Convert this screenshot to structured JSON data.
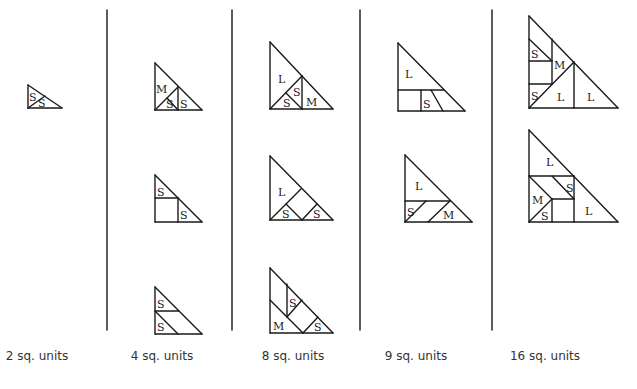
{
  "captions": [
    {
      "text": "2 sq. units",
      "x": 37
    },
    {
      "text": "4 sq. units",
      "x": 162
    },
    {
      "text": "8 sq. units",
      "x": 293
    },
    {
      "text": "9 sq. units",
      "x": 416
    },
    {
      "text": "16 sq. units",
      "x": 545
    }
  ],
  "dividers": [
    107,
    232,
    360,
    492
  ],
  "divider_y": [
    10,
    330
  ],
  "colors": {
    "line": "#1a1a1a",
    "divider": "#333333",
    "caption": "#333333"
  },
  "figures": [
    {
      "name": "figure-2-units",
      "lines": [
        [
          28,
          85,
          28,
          108
        ],
        [
          28,
          108,
          62,
          108
        ],
        [
          28,
          85,
          62,
          108
        ],
        [
          28,
          108,
          45,
          96
        ]
      ],
      "labels": [
        {
          "t": "S",
          "x": 29,
          "y": 101
        },
        {
          "t": "S",
          "x": 38,
          "y": 107
        }
      ]
    },
    {
      "name": "figure-4-units-a",
      "lines": [
        [
          155,
          63,
          155,
          110
        ],
        [
          155,
          110,
          202,
          110
        ],
        [
          155,
          63,
          202,
          110
        ],
        [
          178,
          87,
          178,
          110
        ],
        [
          155,
          110,
          178,
          87
        ],
        [
          167,
          98,
          178,
          110
        ]
      ],
      "labels": [
        {
          "t": "M",
          "x": 156,
          "y": 93
        },
        {
          "t": "S",
          "x": 166,
          "y": 108
        },
        {
          "t": "S",
          "x": 180,
          "y": 108
        }
      ]
    },
    {
      "name": "figure-4-units-b",
      "lines": [
        [
          155,
          175,
          155,
          222
        ],
        [
          155,
          222,
          202,
          222
        ],
        [
          155,
          175,
          202,
          222
        ],
        [
          155,
          198,
          178,
          198
        ],
        [
          178,
          198,
          178,
          222
        ]
      ],
      "labels": [
        {
          "t": "S",
          "x": 157,
          "y": 196
        },
        {
          "t": "S",
          "x": 180,
          "y": 219
        }
      ]
    },
    {
      "name": "figure-4-units-c",
      "lines": [
        [
          155,
          287,
          155,
          334
        ],
        [
          155,
          334,
          202,
          334
        ],
        [
          155,
          287,
          202,
          334
        ],
        [
          155,
          311,
          179,
          311
        ],
        [
          155,
          311,
          178,
          334
        ]
      ],
      "labels": [
        {
          "t": "S",
          "x": 157,
          "y": 308
        },
        {
          "t": "S",
          "x": 157,
          "y": 331
        }
      ]
    },
    {
      "name": "figure-8-units-a",
      "lines": [
        [
          270,
          42,
          270,
          109
        ],
        [
          270,
          109,
          333,
          109
        ],
        [
          270,
          42,
          333,
          109
        ],
        [
          302,
          76,
          302,
          109
        ],
        [
          270,
          109,
          302,
          76
        ],
        [
          286,
          93,
          302,
          109
        ]
      ],
      "labels": [
        {
          "t": "L",
          "x": 278,
          "y": 83
        },
        {
          "t": "S",
          "x": 283,
          "y": 107
        },
        {
          "t": "S",
          "x": 293,
          "y": 96
        },
        {
          "t": "M",
          "x": 306,
          "y": 106
        }
      ]
    },
    {
      "name": "figure-8-units-b",
      "lines": [
        [
          270,
          156,
          270,
          220
        ],
        [
          270,
          220,
          333,
          220
        ],
        [
          270,
          156,
          333,
          220
        ],
        [
          270,
          220,
          301,
          189
        ],
        [
          286,
          204,
          302,
          220
        ],
        [
          302,
          220,
          317,
          204
        ]
      ],
      "labels": [
        {
          "t": "L",
          "x": 278,
          "y": 196
        },
        {
          "t": "S",
          "x": 282,
          "y": 218
        },
        {
          "t": "S",
          "x": 313,
          "y": 218
        }
      ]
    },
    {
      "name": "figure-8-units-c",
      "lines": [
        [
          270,
          268,
          270,
          333
        ],
        [
          270,
          333,
          333,
          333
        ],
        [
          270,
          268,
          333,
          333
        ],
        [
          270,
          300,
          303,
          333
        ],
        [
          287,
          284,
          287,
          317
        ],
        [
          287,
          317,
          302,
          300
        ],
        [
          303,
          333,
          318,
          317
        ]
      ],
      "labels": [
        {
          "t": "S",
          "x": 289,
          "y": 307
        },
        {
          "t": "M",
          "x": 273,
          "y": 330
        },
        {
          "t": "S",
          "x": 314,
          "y": 331
        }
      ]
    },
    {
      "name": "figure-9-units-a",
      "lines": [
        [
          398,
          43,
          398,
          111
        ],
        [
          398,
          111,
          465,
          111
        ],
        [
          398,
          43,
          465,
          111
        ],
        [
          398,
          90,
          444,
          90
        ],
        [
          421,
          90,
          421,
          111
        ],
        [
          431,
          90,
          443,
          111
        ]
      ],
      "labels": [
        {
          "t": "L",
          "x": 405,
          "y": 78
        },
        {
          "t": "S",
          "x": 423,
          "y": 108
        }
      ]
    },
    {
      "name": "figure-9-units-b",
      "lines": [
        [
          405,
          155,
          405,
          222
        ],
        [
          405,
          222,
          472,
          222
        ],
        [
          405,
          155,
          472,
          222
        ],
        [
          405,
          201,
          450,
          201
        ],
        [
          405,
          222,
          426,
          201
        ],
        [
          428,
          222,
          450,
          201
        ]
      ],
      "labels": [
        {
          "t": "L",
          "x": 415,
          "y": 190
        },
        {
          "t": "S",
          "x": 407,
          "y": 216
        },
        {
          "t": "M",
          "x": 443,
          "y": 219
        }
      ]
    },
    {
      "name": "figure-16-units-a",
      "lines": [
        [
          529,
          16,
          529,
          108
        ],
        [
          529,
          108,
          618,
          108
        ],
        [
          529,
          16,
          618,
          108
        ],
        [
          529,
          39,
          552,
          61
        ],
        [
          529,
          61,
          552,
          61
        ],
        [
          552,
          39,
          552,
          84
        ],
        [
          529,
          84,
          552,
          84
        ],
        [
          529,
          108,
          574,
          62
        ],
        [
          574,
          62,
          574,
          108
        ]
      ],
      "labels": [
        {
          "t": "S",
          "x": 531,
          "y": 58
        },
        {
          "t": "M",
          "x": 554,
          "y": 69
        },
        {
          "t": "S",
          "x": 531,
          "y": 100
        },
        {
          "t": "L",
          "x": 557,
          "y": 101
        },
        {
          "t": "L",
          "x": 587,
          "y": 101
        }
      ]
    },
    {
      "name": "figure-16-units-b",
      "lines": [
        [
          529,
          130,
          529,
          222
        ],
        [
          529,
          222,
          618,
          222
        ],
        [
          529,
          130,
          618,
          222
        ],
        [
          529,
          176,
          574,
          176
        ],
        [
          574,
          176,
          574,
          222
        ],
        [
          529,
          176,
          552,
          199
        ],
        [
          552,
          199,
          574,
          199
        ],
        [
          552,
          199,
          552,
          222
        ],
        [
          529,
          222,
          552,
          199
        ],
        [
          552,
          176,
          574,
          199
        ]
      ],
      "labels": [
        {
          "t": "L",
          "x": 546,
          "y": 166
        },
        {
          "t": "S",
          "x": 566,
          "y": 192
        },
        {
          "t": "M",
          "x": 532,
          "y": 204
        },
        {
          "t": "S",
          "x": 541,
          "y": 220
        },
        {
          "t": "L",
          "x": 585,
          "y": 215
        }
      ]
    }
  ]
}
